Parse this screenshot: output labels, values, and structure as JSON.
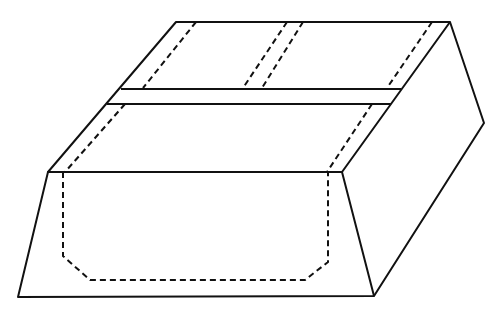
{
  "diagram": {
    "title": "",
    "colors": {
      "background": "#ffffff",
      "stroke": "#111111"
    },
    "labels": []
  }
}
